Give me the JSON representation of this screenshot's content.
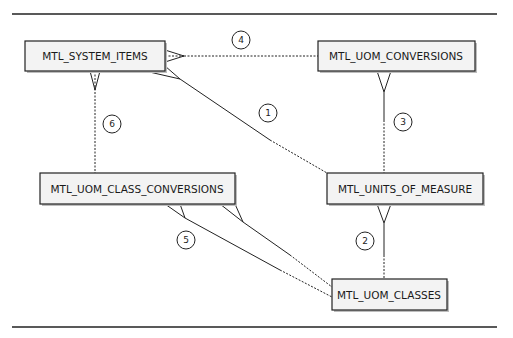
{
  "entities": {
    "system_items": {
      "label": "MTL_SYSTEM_ITEMS"
    },
    "uom_conversions": {
      "label": "MTL_UOM_CONVERSIONS"
    },
    "uom_class_conversions": {
      "label": "MTL_UOM_CLASS_CONVERSIONS"
    },
    "units_of_measure": {
      "label": "MTL_UNITS_OF_MEASURE"
    },
    "uom_classes": {
      "label": "MTL_UOM_CLASSES"
    }
  },
  "relationships": [
    {
      "number": "1",
      "from": "MTL_UNITS_OF_MEASURE",
      "to": "MTL_SYSTEM_ITEMS",
      "cardinality": "one-to-many"
    },
    {
      "number": "2",
      "from": "MTL_UOM_CLASSES",
      "to": "MTL_UNITS_OF_MEASURE",
      "cardinality": "one-to-many"
    },
    {
      "number": "3",
      "from": "MTL_UNITS_OF_MEASURE",
      "to": "MTL_UOM_CONVERSIONS",
      "cardinality": "one-to-many"
    },
    {
      "number": "4",
      "from": "MTL_UOM_CONVERSIONS",
      "to": "MTL_SYSTEM_ITEMS",
      "cardinality": "one-to-many"
    },
    {
      "number": "5",
      "from": "MTL_UOM_CLASSES",
      "to": "MTL_UOM_CLASS_CONVERSIONS",
      "cardinality": "one-to-many (x2)"
    },
    {
      "number": "6",
      "from": "MTL_UOM_CLASS_CONVERSIONS",
      "to": "MTL_SYSTEM_ITEMS",
      "cardinality": "one-to-many"
    }
  ],
  "badges": {
    "r1": "1",
    "r2": "2",
    "r3": "3",
    "r4": "4",
    "r5": "5",
    "r6": "6"
  }
}
